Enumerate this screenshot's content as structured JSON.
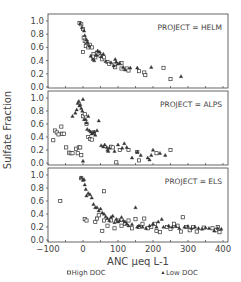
{
  "chart_data": {
    "type": "scatter",
    "ylabel": "Sulfate Fraction",
    "xlabel": "ANC  μeq  L-1",
    "xlim": [
      -100,
      420
    ],
    "ylim": [
      0,
      1.05
    ],
    "x_ticks": [
      "-100",
      "0",
      "100",
      "200",
      "300",
      "400"
    ],
    "y_ticks": [
      "0.0",
      "0.2",
      "0.4",
      "0.6",
      "0.8",
      "1.0"
    ],
    "legend": [
      {
        "name": "High DOC",
        "marker": "square"
      },
      {
        "name": "Low DOC",
        "marker": "triangle"
      }
    ],
    "panels": [
      {
        "label": "PROJECT = HELM",
        "series": [
          {
            "name": "High DOC",
            "points": [
              [
                -10,
                0.97
              ],
              [
                -5,
                0.95
              ],
              [
                0,
                0.88
              ],
              [
                2,
                0.75
              ],
              [
                5,
                0.7
              ],
              [
                8,
                0.62
              ],
              [
                0,
                0.53
              ],
              [
                15,
                0.6
              ],
              [
                20,
                0.64
              ],
              [
                25,
                0.6
              ],
              [
                30,
                0.5
              ],
              [
                35,
                0.45
              ],
              [
                40,
                0.52
              ],
              [
                45,
                0.5
              ],
              [
                50,
                0.47
              ],
              [
                55,
                0.42
              ],
              [
                60,
                0.45
              ],
              [
                70,
                0.38
              ],
              [
                75,
                0.35
              ],
              [
                90,
                0.34
              ],
              [
                92,
                0.3
              ],
              [
                110,
                0.36
              ],
              [
                125,
                0.28
              ],
              [
                130,
                0.25
              ],
              [
                160,
                0.24
              ],
              [
                175,
                0.22
              ],
              [
                178,
                0.18
              ],
              [
                230,
                0.29
              ],
              [
                250,
                0.12
              ],
              [
                110,
                0.28
              ],
              [
                10,
                0.68
              ],
              [
                28,
                0.46
              ]
            ]
          },
          {
            "name": "Low DOC",
            "points": [
              [
                -8,
                0.96
              ],
              [
                -3,
                0.9
              ],
              [
                3,
                0.85
              ],
              [
                5,
                0.78
              ],
              [
                10,
                0.72
              ],
              [
                12,
                0.68
              ],
              [
                18,
                0.62
              ],
              [
                22,
                0.47
              ],
              [
                28,
                0.42
              ],
              [
                32,
                0.4
              ],
              [
                38,
                0.48
              ],
              [
                42,
                0.55
              ],
              [
                48,
                0.53
              ],
              [
                52,
                0.46
              ],
              [
                58,
                0.5
              ],
              [
                65,
                0.39
              ],
              [
                80,
                0.37
              ],
              [
                88,
                0.32
              ],
              [
                92,
                0.42
              ],
              [
                95,
                0.38
              ],
              [
                100,
                0.35
              ],
              [
                105,
                0.36
              ],
              [
                115,
                0.3
              ],
              [
                120,
                0.26
              ],
              [
                135,
                0.29
              ],
              [
                155,
                0.29
              ],
              [
                195,
                0.3
              ],
              [
                280,
                0.16
              ]
            ]
          }
        ]
      },
      {
        "label": "PROJECT = ALPS",
        "series": [
          {
            "name": "High DOC",
            "points": [
              [
                -85,
                0.35
              ],
              [
                -80,
                0.5
              ],
              [
                -75,
                0.47
              ],
              [
                -70,
                0.44
              ],
              [
                -62,
                0.56
              ],
              [
                -60,
                0.45
              ],
              [
                -55,
                0.45
              ],
              [
                -48,
                0.24
              ],
              [
                -40,
                0.16
              ],
              [
                -35,
                0.15
              ],
              [
                -30,
                0.15
              ],
              [
                -20,
                0.22
              ],
              [
                -15,
                0.15
              ],
              [
                -12,
                0.24
              ],
              [
                -8,
                0.24
              ],
              [
                -5,
                0.12
              ],
              [
                0,
                0.72
              ],
              [
                5,
                0.75
              ],
              [
                10,
                0.6
              ],
              [
                15,
                0.4
              ],
              [
                20,
                0.37
              ],
              [
                25,
                0.36
              ],
              [
                30,
                0.47
              ],
              [
                80,
                0.25
              ],
              [
                95,
                0.01
              ],
              [
                105,
                0.2
              ],
              [
                130,
                0.2
              ],
              [
                160,
                0.04
              ],
              [
                155,
                0.17
              ],
              [
                210,
                0.15
              ],
              [
                250,
                0.2
              ],
              [
                85,
                0.24
              ]
            ]
          },
          {
            "name": "Low DOC",
            "points": [
              [
                -30,
                0.72
              ],
              [
                -22,
                0.77
              ],
              [
                -18,
                0.82
              ],
              [
                -15,
                0.92
              ],
              [
                -12,
                0.95
              ],
              [
                -10,
                0.88
              ],
              [
                -8,
                0.9
              ],
              [
                -5,
                0.84
              ],
              [
                0,
                0.98
              ],
              [
                -2,
                0.8
              ],
              [
                3,
                0.67
              ],
              [
                8,
                0.67
              ],
              [
                10,
                0.62
              ],
              [
                12,
                0.52
              ],
              [
                15,
                0.72
              ],
              [
                18,
                0.5
              ],
              [
                22,
                0.48
              ],
              [
                25,
                0.45
              ],
              [
                28,
                0.46
              ],
              [
                32,
                0.48
              ],
              [
                35,
                0.43
              ],
              [
                40,
                0.5
              ],
              [
                45,
                0.65
              ],
              [
                52,
                0.27
              ],
              [
                58,
                0.25
              ],
              [
                62,
                0.28
              ],
              [
                68,
                0.24
              ],
              [
                70,
                0.2
              ],
              [
                72,
                0.18
              ],
              [
                75,
                0.23
              ],
              [
                90,
                0.18
              ],
              [
                100,
                0.28
              ],
              [
                112,
                0.23
              ],
              [
                118,
                0.3
              ],
              [
                125,
                0.24
              ],
              [
                140,
                0.08
              ],
              [
                155,
                0.17
              ],
              [
                165,
                0.12
              ],
              [
                185,
                0.08
              ],
              [
                190,
                0.05
              ],
              [
                195,
                0.12
              ],
              [
                200,
                0.2
              ],
              [
                220,
                0.15
              ],
              [
                235,
                0.12
              ],
              [
                0,
                0.03
              ]
            ]
          }
        ]
      },
      {
        "label": "PROJECT = ELS",
        "series": [
          {
            "name": "High DOC",
            "points": [
              [
                -65,
                0.6
              ],
              [
                -5,
                0.95
              ],
              [
                5,
                0.32
              ],
              [
                10,
                0.3
              ],
              [
                60,
                0.75
              ],
              [
                35,
                0.28
              ],
              [
                40,
                0.33
              ],
              [
                45,
                0.38
              ],
              [
                55,
                0.14
              ],
              [
                60,
                0.3
              ],
              [
                70,
                0.22
              ],
              [
                80,
                0.3
              ],
              [
                90,
                0.18
              ],
              [
                100,
                0.3
              ],
              [
                110,
                0.22
              ],
              [
                120,
                0.25
              ],
              [
                130,
                0.3
              ],
              [
                140,
                0.18
              ],
              [
                150,
                0.32
              ],
              [
                160,
                0.2
              ],
              [
                170,
                0.25
              ],
              [
                175,
                0.33
              ],
              [
                185,
                0.18
              ],
              [
                195,
                0.2
              ],
              [
                205,
                0.25
              ],
              [
                210,
                0.14
              ],
              [
                220,
                0.12
              ],
              [
                240,
                0.2
              ],
              [
                250,
                0.17
              ],
              [
                260,
                0.25
              ],
              [
                270,
                0.22
              ],
              [
                280,
                0.13
              ],
              [
                285,
                0.35
              ],
              [
                295,
                0.2
              ],
              [
                305,
                0.15
              ],
              [
                315,
                0.2
              ],
              [
                325,
                0.13
              ],
              [
                345,
                0.19
              ],
              [
                370,
                0.18
              ],
              [
                385,
                0.2
              ],
              [
                390,
                0.12
              ],
              [
                380,
                0.15
              ]
            ]
          },
          {
            "name": "Low DOC",
            "points": [
              [
                -5,
                0.96
              ],
              [
                0,
                0.92
              ],
              [
                3,
                0.93
              ],
              [
                5,
                0.85
              ],
              [
                8,
                0.78
              ],
              [
                10,
                0.68
              ],
              [
                15,
                0.72
              ],
              [
                20,
                0.7
              ],
              [
                25,
                0.65
              ],
              [
                30,
                0.55
              ],
              [
                35,
                0.5
              ],
              [
                40,
                0.5
              ],
              [
                45,
                0.45
              ],
              [
                50,
                0.48
              ],
              [
                55,
                0.42
              ],
              [
                60,
                0.4
              ],
              [
                65,
                0.36
              ],
              [
                70,
                0.33
              ],
              [
                75,
                0.3
              ],
              [
                80,
                0.35
              ],
              [
                85,
                0.37
              ],
              [
                90,
                0.27
              ],
              [
                95,
                0.32
              ],
              [
                100,
                0.28
              ],
              [
                105,
                0.3
              ],
              [
                110,
                0.35
              ],
              [
                115,
                0.3
              ],
              [
                120,
                0.28
              ],
              [
                125,
                0.25
              ],
              [
                130,
                0.22
              ],
              [
                140,
                0.24
              ],
              [
                150,
                0.5
              ],
              [
                155,
                0.2
              ],
              [
                160,
                0.22
              ],
              [
                170,
                0.2
              ],
              [
                180,
                0.18
              ],
              [
                190,
                0.22
              ],
              [
                200,
                0.25
              ],
              [
                210,
                0.2
              ],
              [
                215,
                0.28
              ],
              [
                225,
                0.32
              ],
              [
                230,
                0.2
              ],
              [
                245,
                0.22
              ],
              [
                255,
                0.2
              ],
              [
                265,
                0.21
              ],
              [
                275,
                0.18
              ],
              [
                290,
                0.2
              ],
              [
                300,
                0.21
              ],
              [
                310,
                0.18
              ],
              [
                320,
                0.2
              ],
              [
                330,
                0.18
              ],
              [
                340,
                0.17
              ],
              [
                350,
                0.19
              ],
              [
                360,
                0.18
              ],
              [
                375,
                0.14
              ],
              [
                385,
                0.18
              ],
              [
                395,
                0.17
              ]
            ]
          }
        ]
      }
    ]
  }
}
